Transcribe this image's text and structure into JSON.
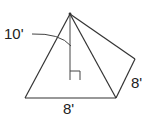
{
  "diagram": {
    "type": "square-pyramid",
    "labels": {
      "height": "10'",
      "base_front": "8'",
      "base_side": "8'"
    },
    "colors": {
      "stroke": "#333333",
      "text": "#222222",
      "background": "#ffffff"
    }
  }
}
